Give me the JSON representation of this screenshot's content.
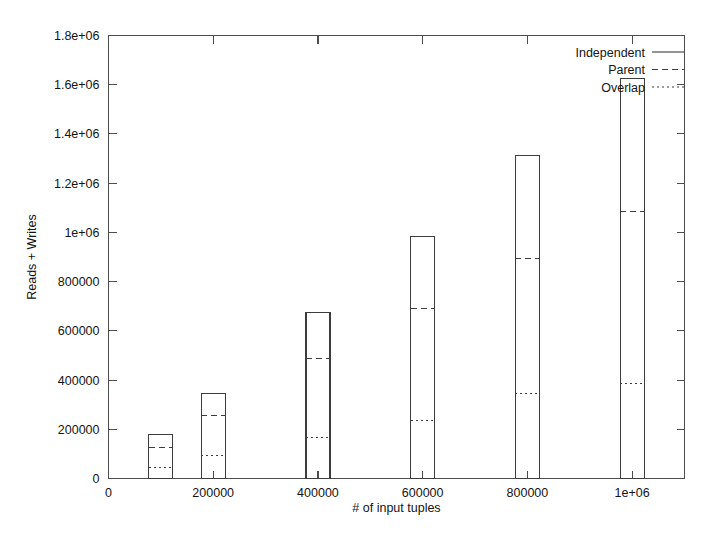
{
  "chart_data": {
    "type": "bar",
    "title": "",
    "xlabel": "# of input tuples",
    "ylabel": "Reads + Writes",
    "xlim": [
      0,
      1100000
    ],
    "ylim": [
      0,
      1800000
    ],
    "grid": false,
    "legend_position": "top-right",
    "x_ticks": [
      {
        "value": 0,
        "label": "0"
      },
      {
        "value": 200000,
        "label": "200000"
      },
      {
        "value": 400000,
        "label": "400000"
      },
      {
        "value": 600000,
        "label": "600000"
      },
      {
        "value": 800000,
        "label": "800000"
      },
      {
        "value": 1000000,
        "label": "1e+06"
      }
    ],
    "y_ticks": [
      {
        "value": 0,
        "label": "0"
      },
      {
        "value": 200000,
        "label": "200000"
      },
      {
        "value": 400000,
        "label": "400000"
      },
      {
        "value": 600000,
        "label": "600000"
      },
      {
        "value": 800000,
        "label": "800000"
      },
      {
        "value": 1000000,
        "label": "1e+06"
      },
      {
        "value": 1200000,
        "label": "1.2e+06"
      },
      {
        "value": 1400000,
        "label": "1.4e+06"
      },
      {
        "value": 1600000,
        "label": "1.6e+06"
      },
      {
        "value": 1800000,
        "label": "1.8e+06"
      }
    ],
    "categories": [
      100000,
      200000,
      400000,
      600000,
      800000,
      1000000
    ],
    "series": [
      {
        "name": "Independent",
        "style": "solid",
        "values": [
          179000,
          345000,
          675000,
          984000,
          1313000,
          1626000
        ]
      },
      {
        "name": "Parent",
        "style": "dashed",
        "values": [
          126000,
          256000,
          488000,
          691000,
          894000,
          1085000
        ]
      },
      {
        "name": "Overlap",
        "style": "dotted",
        "values": [
          45000,
          93000,
          167000,
          236000,
          345000,
          386000
        ]
      }
    ]
  },
  "legend": {
    "entries": [
      {
        "label": "Independent",
        "style": "solid"
      },
      {
        "label": "Parent",
        "style": "dashed"
      },
      {
        "label": "Overlap",
        "style": "dotted"
      }
    ]
  }
}
